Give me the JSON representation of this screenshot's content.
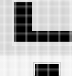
{
  "image": {
    "width": 72,
    "height": 76,
    "description": "Heavily magnified low-resolution screenshot fragment",
    "content_summary": "A large black L-shaped glyph on a light gray field, with a smaller solid black rectangle below on a near-white field"
  },
  "colors": {
    "background_upper": "#d9d9d9",
    "background_lower": "#f3f3f3",
    "glyph": "#000000",
    "halo": "#c9c9c9",
    "page": "#ffffff"
  },
  "shapes": {
    "glyph_l": {
      "name": "letter-l-glyph",
      "label": "L",
      "x": 14,
      "y": 2,
      "width": 58,
      "height": 40,
      "stem_width": 18,
      "foot_height": 11,
      "color": "#000000"
    },
    "block_lower": {
      "name": "solid-block",
      "label": "",
      "x": 35,
      "y": 64,
      "width": 24,
      "height": 12,
      "color": "#000000"
    }
  },
  "bands": [
    {
      "name": "upper-gray-band",
      "y": 0,
      "height": 56,
      "color": "#d9d9d9"
    },
    {
      "name": "lower-white-band",
      "y": 56,
      "height": 20,
      "color": "#f3f3f3"
    }
  ]
}
